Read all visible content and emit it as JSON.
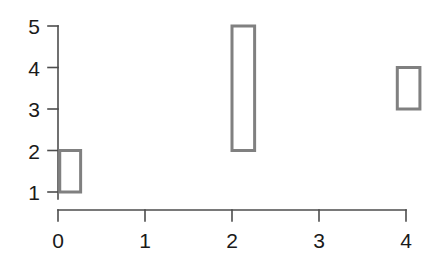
{
  "chart_data": {
    "type": "bar",
    "title": "",
    "subtitle": "",
    "xlabel": "",
    "ylabel": "",
    "xlim": [
      -0.1,
      4.35
    ],
    "ylim": [
      0.62,
      5.0
    ],
    "grid": false,
    "legend": null,
    "legend_position": "none",
    "style": {
      "box_fill": "#ffffff",
      "box_stroke": "#808080",
      "axis_color": "#4d4d4d",
      "text_color": "#1a1a1a",
      "background": "#ffffff",
      "spines": "detached"
    },
    "x_ticks": [
      0,
      1,
      2,
      3,
      4
    ],
    "x_tick_labels": [
      "0",
      "1",
      "2",
      "3",
      "4"
    ],
    "y_ticks": [
      1,
      2,
      3,
      4,
      5
    ],
    "y_tick_labels": [
      "1",
      "2",
      "3",
      "4",
      "5"
    ],
    "categories": [
      "0",
      "2",
      "4"
    ],
    "values": [
      2,
      5,
      4
    ],
    "bottoms": [
      1,
      2,
      3
    ],
    "boxes": [
      {
        "name": "box-1",
        "x_start": 0.02,
        "x_end": 0.26,
        "y_bottom": 1,
        "y_top": 2,
        "height": 1
      },
      {
        "name": "box-2",
        "x_start": 2.0,
        "x_end": 2.26,
        "y_bottom": 2,
        "y_top": 5,
        "height": 3
      },
      {
        "name": "box-3",
        "x_start": 3.9,
        "x_end": 4.16,
        "y_bottom": 3,
        "y_top": 4,
        "height": 1
      }
    ]
  },
  "axes": {
    "x_axis_name": "x-axis",
    "y_axis_name": "y-axis"
  }
}
